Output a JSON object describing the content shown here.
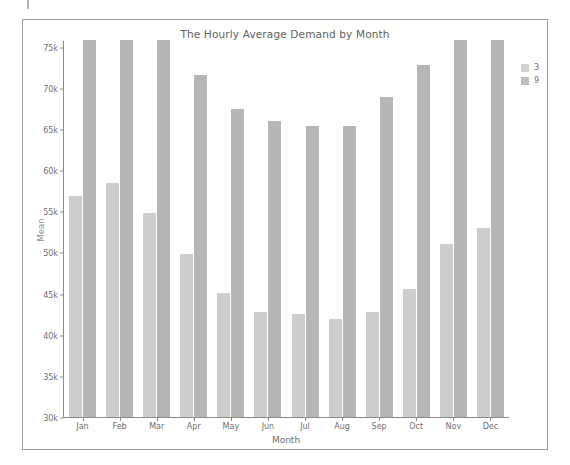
{
  "chart_data": {
    "type": "bar",
    "title": "The Hourly Average Demand by Month",
    "xlabel": "Month",
    "ylabel": "Mean",
    "categories": [
      "Jan",
      "Feb",
      "Mar",
      "Apr",
      "May",
      "Jun",
      "Jul",
      "Aug",
      "Sep",
      "Oct",
      "Nov",
      "Dec"
    ],
    "series": [
      {
        "name": "3",
        "color": "#cdcdcd",
        "values": [
          56800,
          58400,
          54800,
          49800,
          45100,
          42700,
          42500,
          41900,
          42800,
          45600,
          51000,
          53000
        ]
      },
      {
        "name": "9",
        "color": "#b6b6b6",
        "values": [
          76200,
          76400,
          76000,
          71500,
          67400,
          66000,
          65400,
          65300,
          68900,
          72800,
          76300,
          76100
        ]
      }
    ],
    "ylim": [
      30000,
      75800
    ],
    "yticks": [
      30000,
      35000,
      40000,
      45000,
      50000,
      55000,
      60000,
      65000,
      70000,
      75000
    ],
    "ytick_labels": [
      "30k",
      "35k",
      "40k",
      "45k",
      "50k",
      "55k",
      "60k",
      "65k",
      "70k",
      "75k"
    ],
    "grid": false,
    "legend_position": "right",
    "legend_title": ""
  }
}
